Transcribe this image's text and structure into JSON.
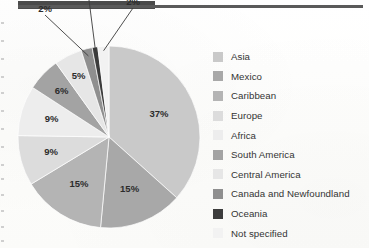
{
  "page": {
    "background_color": "#fdfdfc",
    "header_block_color": "#4b4b4b",
    "header_rule_color": "#5a5a5a"
  },
  "chart_data": {
    "type": "pie",
    "title": "",
    "subtitle": "",
    "xlabel": "",
    "ylabel": "",
    "legend_position": "right",
    "grid": false,
    "units": "percent",
    "total": 101,
    "start_angle_deg": 0,
    "direction": "clockwise",
    "categories": [
      "Asia",
      "Mexico",
      "Caribbean",
      "Europe",
      "Africa",
      "South America",
      "Central America",
      "Canada and Newfoundland",
      "Oceania",
      "Not specified"
    ],
    "values": [
      37,
      15,
      15,
      9,
      9,
      6,
      5,
      2,
      1,
      2
    ],
    "data_labels": [
      "37%",
      "15%",
      "15%",
      "9%",
      "9%",
      "6%",
      "5%",
      "2%",
      "1%",
      "2%"
    ],
    "colors": [
      "#c9c9c9",
      "#a8a8a8",
      "#b4b4b4",
      "#dcdcdc",
      "#ededed",
      "#a3a3a3",
      "#e6e6e6",
      "#8f8f8f",
      "#3c3c3c",
      "#f2f2f2"
    ],
    "slices": [
      {
        "label": "Asia",
        "value": 37,
        "data_label": "37%",
        "color": "#c9c9c9",
        "callout": false
      },
      {
        "label": "Mexico",
        "value": 15,
        "data_label": "15%",
        "color": "#a8a8a8",
        "callout": false
      },
      {
        "label": "Caribbean",
        "value": 15,
        "data_label": "15%",
        "color": "#b4b4b4",
        "callout": false
      },
      {
        "label": "Europe",
        "value": 9,
        "data_label": "9%",
        "color": "#dcdcdc",
        "callout": false
      },
      {
        "label": "Africa",
        "value": 9,
        "data_label": "9%",
        "color": "#ededed",
        "callout": false
      },
      {
        "label": "South America",
        "value": 6,
        "data_label": "6%",
        "color": "#a3a3a3",
        "callout": false
      },
      {
        "label": "Central America",
        "value": 5,
        "data_label": "5%",
        "color": "#e6e6e6",
        "callout": false
      },
      {
        "label": "Canada and Newfoundland",
        "value": 2,
        "data_label": "2%",
        "color": "#8f8f8f",
        "callout": true
      },
      {
        "label": "Oceania",
        "value": 1,
        "data_label": "1%",
        "color": "#3c3c3c",
        "callout": true
      },
      {
        "label": "Not specified",
        "value": 2,
        "data_label": "2%",
        "color": "#f2f2f2",
        "callout": true
      }
    ]
  },
  "legend": {
    "items": [
      {
        "label": "Asia",
        "color": "#c9c9c9"
      },
      {
        "label": "Mexico",
        "color": "#a8a8a8"
      },
      {
        "label": "Caribbean",
        "color": "#b4b4b4"
      },
      {
        "label": "Europe",
        "color": "#dcdcdc"
      },
      {
        "label": "Africa",
        "color": "#ededed"
      },
      {
        "label": "South America",
        "color": "#a3a3a3"
      },
      {
        "label": "Central America",
        "color": "#e6e6e6"
      },
      {
        "label": "Canada and Newfoundland",
        "color": "#8f8f8f"
      },
      {
        "label": "Oceania",
        "color": "#3c3c3c"
      },
      {
        "label": "Not specified",
        "color": "#f2f2f2"
      }
    ]
  }
}
